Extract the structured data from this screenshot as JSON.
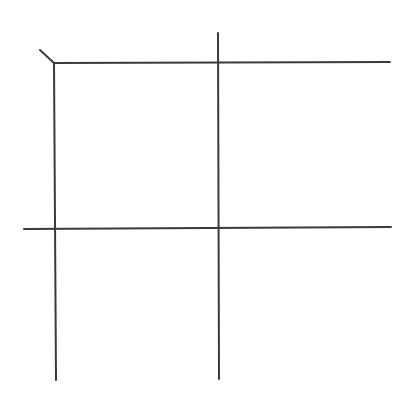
{
  "diagram": {
    "stroke_color": "#3a3a3a",
    "background_color": "#ffffff",
    "lines": [
      {
        "name": "top-horizontal-line"
      },
      {
        "name": "middle-horizontal-line"
      },
      {
        "name": "left-vertical-line"
      },
      {
        "name": "center-vertical-line"
      },
      {
        "name": "corner-diagonal-stroke"
      }
    ]
  }
}
